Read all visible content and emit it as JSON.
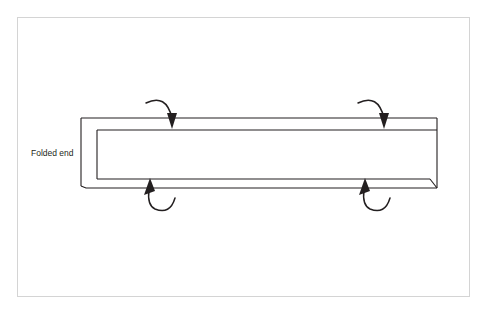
{
  "figure": {
    "background_color": "#ffffff",
    "frame": {
      "name": "slide-border",
      "stroke": "#d4d4d4",
      "x": 17,
      "y": 17,
      "width": 453,
      "height": 280
    },
    "labels": [
      {
        "id": "folded-end-label",
        "text": "Folded end",
        "x": 31,
        "y": 156,
        "font_size": 8.5,
        "color": "#231f20"
      }
    ],
    "beam": {
      "name": "hollow-box-beam",
      "stroke": "#231f20",
      "fill": "#ffffff",
      "left_x": 81,
      "right_x": 437,
      "top_outer_y": 118,
      "top_inner_y": 130,
      "bottom_inner_y": 179,
      "bottom_outer_y": 188,
      "fold_inner_x": 97,
      "description": "Thin-walled rectangular hollow section shown in side elevation with open folded left end"
    },
    "arrows": [
      {
        "id": "arrow-top-left",
        "direction": "down",
        "tip_x": 172,
        "tip_y": 127,
        "arc_start_x": 146,
        "arc_start_y": 103,
        "label": "rotation-arrow-top-left"
      },
      {
        "id": "arrow-top-right",
        "direction": "down",
        "tip_x": 384,
        "tip_y": 127,
        "arc_start_x": 358,
        "arc_start_y": 103,
        "label": "rotation-arrow-top-right"
      },
      {
        "id": "arrow-bottom-left",
        "direction": "up",
        "tip_x": 149,
        "tip_y": 180,
        "arc_start_x": 175,
        "arc_start_y": 204,
        "label": "rotation-arrow-bottom-left"
      },
      {
        "id": "arrow-bottom-right",
        "direction": "up",
        "tip_x": 364,
        "tip_y": 180,
        "arc_start_x": 390,
        "arc_start_y": 204,
        "label": "rotation-arrow-bottom-right"
      }
    ]
  }
}
